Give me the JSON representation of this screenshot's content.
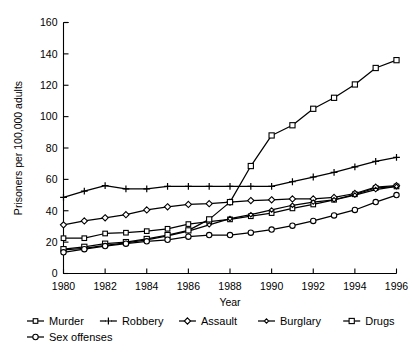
{
  "chart_data": {
    "type": "line",
    "title": "",
    "xlabel": "Year",
    "ylabel": "Prisoners per 100,000 adults",
    "grid": false,
    "legend_position": "below-axes",
    "xlim": [
      1980,
      1996
    ],
    "ylim": [
      0,
      160
    ],
    "xticks": [
      1980,
      1982,
      1984,
      1986,
      1988,
      1990,
      1992,
      1994,
      1996
    ],
    "yticks": [
      0,
      20,
      40,
      60,
      80,
      100,
      120,
      140,
      160
    ],
    "x": [
      1980,
      1981,
      1982,
      1983,
      1984,
      1985,
      1986,
      1987,
      1988,
      1989,
      1990,
      1991,
      1992,
      1993,
      1994,
      1995,
      1996
    ],
    "series": [
      {
        "name": "Murder",
        "marker": "square",
        "values": [
          22.5,
          22.5,
          25.5,
          26,
          27,
          28.5,
          31.5,
          33,
          34.5,
          36.5,
          38.5,
          41.5,
          44,
          47,
          50.5,
          54.5,
          55.5
        ]
      },
      {
        "name": "Robbery",
        "marker": "plus",
        "values": [
          48.5,
          52.5,
          56,
          54,
          54,
          55.5,
          55.5,
          55.5,
          55.5,
          55.5,
          55.5,
          58.5,
          61.5,
          64.5,
          68,
          71.5,
          74
        ]
      },
      {
        "name": "Assault",
        "marker": "diamond",
        "values": [
          31,
          33.5,
          35.5,
          37.5,
          40.5,
          42.5,
          44,
          44.5,
          45.5,
          46.5,
          47,
          47.5,
          47.5,
          48.5,
          51,
          55,
          56
        ]
      },
      {
        "name": "Burglary",
        "marker": "small-diamond",
        "values": [
          15,
          16,
          18,
          19.5,
          21.5,
          24,
          27,
          31,
          35,
          37.5,
          40.5,
          43.5,
          45.5,
          47,
          50,
          53.5,
          55.5
        ]
      },
      {
        "name": "Drugs",
        "marker": "square-open",
        "values": [
          15.5,
          17,
          19,
          20,
          22,
          24.5,
          27.5,
          34.5,
          45.5,
          68.5,
          88,
          94.5,
          105,
          112,
          120.5,
          131,
          136
        ]
      },
      {
        "name": "Sex offenses",
        "marker": "circle",
        "values": [
          13.5,
          15.5,
          17.5,
          19,
          20.5,
          21.5,
          23.5,
          24.5,
          24.5,
          26,
          28,
          30.5,
          33.5,
          37,
          40.5,
          45.5,
          50
        ]
      }
    ],
    "legend": [
      {
        "label": "Murder",
        "marker": "square"
      },
      {
        "label": "Robbery",
        "marker": "plus"
      },
      {
        "label": "Assault",
        "marker": "diamond"
      },
      {
        "label": "Burglary",
        "marker": "small-diamond"
      },
      {
        "label": "Drugs",
        "marker": "square-open"
      },
      {
        "label": "Sex offenses",
        "marker": "circle"
      }
    ],
    "colors": {
      "line": "#000000",
      "marker_fill": "#ffffff",
      "background": "#ffffff"
    }
  }
}
